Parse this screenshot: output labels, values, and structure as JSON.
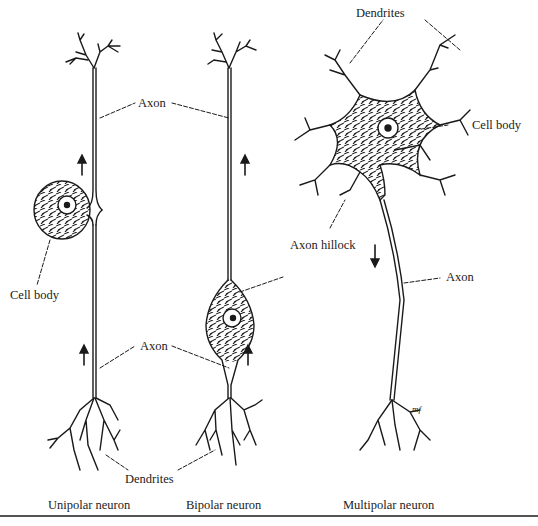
{
  "figure": {
    "neurons": [
      {
        "caption": "Unipolar neuron"
      },
      {
        "caption": "Bipolar neuron"
      },
      {
        "caption": "Multipolar neuron"
      }
    ],
    "labels": {
      "axon_top": "Axon",
      "axon_bottom": "Axon",
      "axon_multipolar": "Axon",
      "cell_body_unipolar": "Cell body",
      "cell_body_multipolar": "Cell body",
      "dendrites_top": "Dendrites",
      "dendrites_bottom": "Dendrites",
      "axon_hillock": "Axon hillock"
    },
    "signature": "mf",
    "colors": {
      "ink": "#1a1a1a",
      "paper": "#ffffff",
      "rule": "#555555"
    }
  }
}
